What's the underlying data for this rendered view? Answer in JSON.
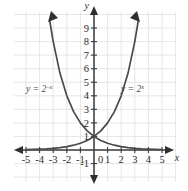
{
  "chart_data": {
    "type": "line",
    "title": "",
    "subtitle": "",
    "xlabel": "x",
    "ylabel": "y",
    "xlim": [
      -5.6,
      5.6
    ],
    "ylim": [
      -1.6,
      9.9
    ],
    "grid": true,
    "grid_spacing": 1,
    "legend": "inline-curve-labels",
    "x_ticks": [
      -5,
      -4,
      -3,
      -2,
      -1,
      0,
      1,
      2,
      3,
      4,
      5
    ],
    "x_tick_labels": [
      "-5",
      "-4",
      "-3",
      "-2",
      "-1",
      "0",
      "1",
      "2",
      "3",
      "4",
      "5"
    ],
    "y_ticks": [
      -1,
      1,
      2,
      3,
      4,
      5,
      6,
      7,
      8,
      9
    ],
    "y_tick_labels": [
      "-1",
      "1",
      "2",
      "3",
      "4",
      "5",
      "6",
      "7",
      "8",
      "9"
    ],
    "origin_label": "0",
    "series": [
      {
        "name": "y = 2^x",
        "label_base": "y = 2",
        "label_exponent": "x",
        "color": "#4a4a4a",
        "x": [
          -5,
          -4.5,
          -4,
          -3.5,
          -3,
          -2.5,
          -2,
          -1.5,
          -1,
          -0.5,
          0,
          0.5,
          1,
          1.5,
          2,
          2.5,
          3,
          3.25
        ],
        "y": [
          0.031,
          0.044,
          0.063,
          0.088,
          0.125,
          0.177,
          0.25,
          0.354,
          0.5,
          0.707,
          1,
          1.414,
          2,
          2.828,
          4,
          5.657,
          8,
          9.514
        ]
      },
      {
        "name": "y = 2^-x",
        "label_base": "y = 2",
        "label_exponent": "-x",
        "color": "#4a4a4a",
        "x": [
          -3.25,
          -3,
          -2.5,
          -2,
          -1.5,
          -1,
          -0.5,
          0,
          0.5,
          1,
          1.5,
          2,
          2.5,
          3,
          3.5,
          4,
          4.5,
          5
        ],
        "y": [
          9.514,
          8,
          5.657,
          4,
          2.828,
          2,
          1.414,
          1,
          0.707,
          0.5,
          0.354,
          0.25,
          0.177,
          0.125,
          0.088,
          0.063,
          0.044,
          0.031
        ]
      }
    ],
    "intersection_point": [
      0,
      1
    ],
    "annotations": [
      {
        "text": "y = 2^-x",
        "x": -3.2,
        "y": 4.3
      },
      {
        "text": "y = 2^x",
        "x": 2.1,
        "y": 4.3
      }
    ]
  },
  "colors": {
    "grid": "#e2dede",
    "axis": "#3b3b3b",
    "curve": "#4a4a4a",
    "text": "#2b2b2b",
    "background": "#ffffff"
  },
  "labels": {
    "x_axis_name": "x",
    "y_axis_name": "y",
    "curve_left_base": "y = 2",
    "curve_left_exp": "–x",
    "curve_right_base": "y = 2",
    "curve_right_exp": "x"
  }
}
